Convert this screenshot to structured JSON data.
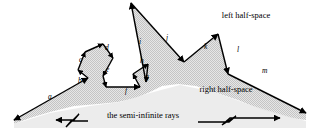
{
  "figure": {
    "background": "#ffffff",
    "fill_color": "#dadada",
    "stroke_color": "#000000",
    "captions": [
      {
        "id": "left-half-space",
        "text": "left half-space",
        "x": 246,
        "y": 18,
        "anchor": "middle"
      },
      {
        "id": "right-half-space",
        "text": "right half-space",
        "x": 226,
        "y": 92,
        "anchor": "middle"
      },
      {
        "id": "semi-infinite-rays",
        "text": "the semi-infinite rays",
        "x": 143,
        "y": 118,
        "anchor": "middle"
      }
    ],
    "edge_labels": [
      {
        "id": "a",
        "text": "a",
        "x": 48,
        "y": 99
      },
      {
        "id": "b",
        "text": "b",
        "x": 78,
        "y": 83
      },
      {
        "id": "c",
        "text": "c",
        "x": 79,
        "y": 62
      },
      {
        "id": "d",
        "text": "d",
        "x": 105,
        "y": 50
      },
      {
        "id": "e",
        "text": "e",
        "x": 106,
        "y": 72
      },
      {
        "id": "f",
        "text": "f",
        "x": 125,
        "y": 93
      },
      {
        "id": "g",
        "text": "g",
        "x": 145,
        "y": 79
      },
      {
        "id": "h",
        "text": "h",
        "x": 140,
        "y": 63
      },
      {
        "id": "i",
        "text": "i",
        "x": 139,
        "y": 44
      },
      {
        "id": "j",
        "text": "j",
        "x": 166,
        "y": 40
      },
      {
        "id": "k",
        "text": "k",
        "x": 204,
        "y": 49
      },
      {
        "id": "l",
        "text": "l",
        "x": 237,
        "y": 52
      },
      {
        "id": "m",
        "text": "m",
        "x": 262,
        "y": 73
      }
    ],
    "chain_vertices": [
      [
        14,
        120
      ],
      [
        88,
        78
      ],
      [
        78,
        70
      ],
      [
        85,
        52
      ],
      [
        103,
        44
      ],
      [
        113,
        58
      ],
      [
        103,
        76
      ],
      [
        106,
        87
      ],
      [
        140,
        87
      ],
      [
        133,
        74
      ],
      [
        148,
        64
      ],
      [
        146,
        82
      ],
      [
        131,
        3
      ],
      [
        184,
        62
      ],
      [
        218,
        34
      ],
      [
        228,
        74
      ],
      [
        306,
        113
      ]
    ],
    "rays": {
      "left": {
        "from": [
          88,
          78
        ],
        "to": [
          14,
          120
        ],
        "arrow": "start"
      },
      "right": {
        "from": [
          228,
          74
        ],
        "to": [
          306,
          113
        ],
        "arrow": "end"
      }
    },
    "break_marks": [
      {
        "id": "left-break",
        "arrow_dir": "left"
      },
      {
        "id": "right-break",
        "arrow_dir": "right"
      }
    ]
  }
}
